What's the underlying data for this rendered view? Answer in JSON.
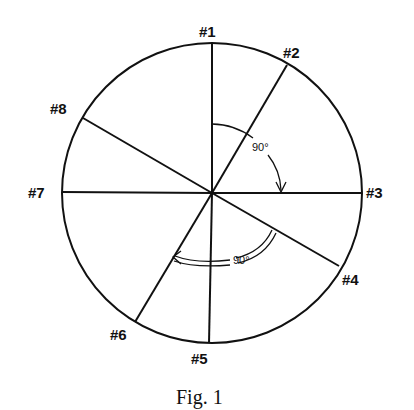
{
  "figure": {
    "caption": "Fig. 1",
    "circle": {
      "cx": 212,
      "cy": 193,
      "r": 150
    },
    "radii": [
      {
        "id": "#1",
        "label": "#1",
        "x2": 212,
        "y2": 43
      },
      {
        "id": "#2",
        "label": "#2",
        "x2": 287,
        "y2": 65
      },
      {
        "id": "#3",
        "label": "#3",
        "x2": 361,
        "y2": 193
      },
      {
        "id": "#4",
        "label": "#4",
        "x2": 339,
        "y2": 266
      },
      {
        "id": "#5",
        "label": "#5",
        "x2": 209,
        "y2": 343
      },
      {
        "id": "#6",
        "label": "#6",
        "x2": 135,
        "y2": 322
      },
      {
        "id": "#7",
        "label": "#7",
        "x2": 62,
        "y2": 192
      },
      {
        "id": "#8",
        "label": "#8",
        "x2": 83,
        "y2": 118
      }
    ],
    "angle_annotations": [
      {
        "label": "90°",
        "from": "#1",
        "to": "#3",
        "style": "single-arc-arrow"
      },
      {
        "label": "90°",
        "from": "#4",
        "to": "#6",
        "style": "double-arc-arrow"
      }
    ]
  },
  "labels": {
    "n1": "#1",
    "n2": "#2",
    "n3": "#3",
    "n4": "#4",
    "n5": "#5",
    "n6": "#6",
    "n7": "#7",
    "n8": "#8",
    "angle_upper": "90°",
    "angle_lower": "90°",
    "caption": "Fig. 1"
  }
}
